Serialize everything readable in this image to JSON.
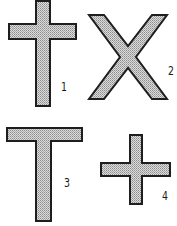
{
  "figure": {
    "fill_color": "#c4c4c4",
    "stroke_color": "#1e1e1e",
    "background": "#ffffff",
    "shapes": [
      {
        "id": 1,
        "name": "latin-cross",
        "label": "1"
      },
      {
        "id": 2,
        "name": "x-saltire-cross",
        "label": "2"
      },
      {
        "id": 3,
        "name": "t-tau-cross",
        "label": "3"
      },
      {
        "id": 4,
        "name": "greek-cross",
        "label": "4"
      }
    ]
  }
}
